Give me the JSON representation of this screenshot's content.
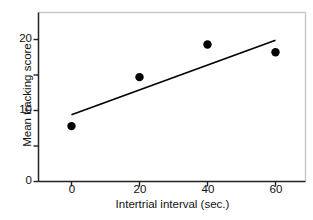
{
  "chart_data": {
    "type": "scatter",
    "title": "",
    "xlabel": "Intertrial interval (sec.)",
    "ylabel": "Mean tracking score",
    "x": [
      0,
      20,
      40,
      60
    ],
    "values": [
      7.8,
      14.7,
      19.3,
      18.2
    ],
    "series": [
      {
        "name": "Mean tracking score",
        "x": [
          0,
          20,
          40,
          60
        ],
        "values": [
          7.8,
          14.7,
          19.3,
          18.2
        ],
        "marker": "filled-circle",
        "color": "#000000"
      },
      {
        "name": "regression line",
        "type": "line",
        "x": [
          0,
          60
        ],
        "values": [
          9.4,
          19.9
        ],
        "color": "#000000"
      }
    ],
    "xlim": [
      -4,
      68
    ],
    "ylim": [
      0,
      24
    ],
    "xticks": [
      0,
      20,
      40,
      60
    ],
    "xtick_labels": [
      "0",
      "20",
      "40",
      "60"
    ],
    "yticks": [
      0,
      5,
      10,
      15,
      20
    ],
    "ytick_labels": [
      "0",
      "",
      "10",
      "",
      "20"
    ],
    "ytick_major_labeled": [
      "0",
      "10",
      "20"
    ],
    "grid": false,
    "legend": false,
    "legend_position": "none",
    "axis_color": "#222222",
    "frame_color": "#c8c8c8",
    "point_color": "#000000",
    "line_color": "#000000",
    "background": "#ffffff"
  },
  "axes": {
    "y_title": "Mean tracking score",
    "x_title": "Intertrial interval (sec.)",
    "y_labels": [
      {
        "text": "20",
        "value": 20
      },
      {
        "text": "10",
        "value": 10
      },
      {
        "text": "0",
        "value": 0
      }
    ],
    "x_labels": [
      {
        "text": "0",
        "value": 0
      },
      {
        "text": "20",
        "value": 20
      },
      {
        "text": "40",
        "value": 40
      },
      {
        "text": "60",
        "value": 60
      }
    ]
  }
}
